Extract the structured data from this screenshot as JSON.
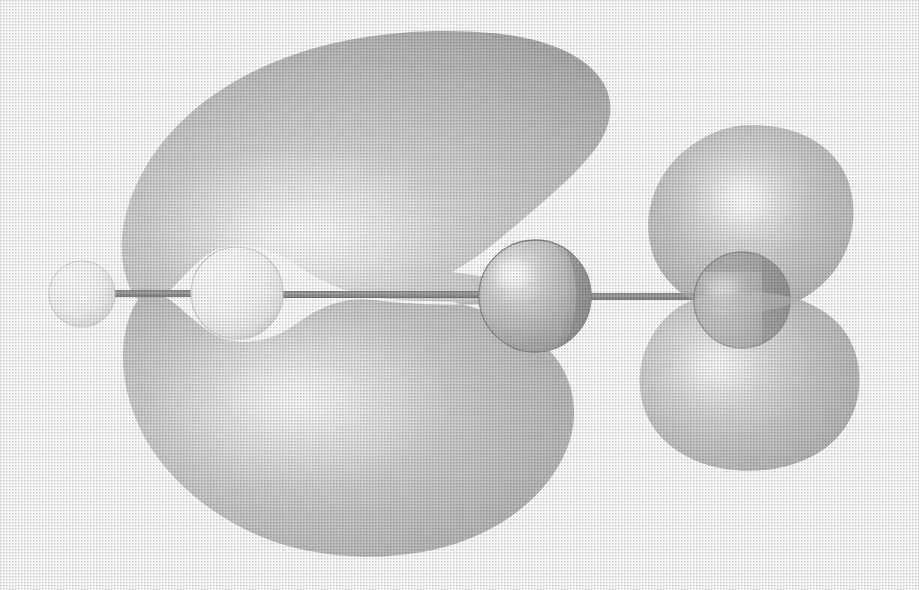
{
  "figure": {
    "kind": "molecular-orbital-isosurface",
    "title": "",
    "caption": "",
    "background_color": "#ffffff",
    "width": 919,
    "height": 590,
    "rendering_style": "halftone grayscale print scan",
    "view": "side view along molecular axis, orbital lobes above and below the bond axis"
  },
  "palette": {
    "background": "#ffffff",
    "lobe_base": "#c4c4c4",
    "lobe_mid": "#cfcfcf",
    "lobe_highlight": "#f2f2f2",
    "lobe_edge": "#a8a8a8",
    "lobe_shadow": "#b2b2b2",
    "atom_white_base": "#fbfbfb",
    "atom_white_edge": "#d8d8d8",
    "atom_mid_base": "#b9b9b9",
    "atom_mid_edge": "#8d8d8d",
    "atom_dark_base": "#9a9a9a",
    "atom_dark_edge": "#6a6a6a",
    "atom_dark_occluded": "#636363",
    "bond_color": "#9b9b9b",
    "bond_edge": "#7e7e7e",
    "specular": "#ffffff"
  },
  "molecule": {
    "axis_y": 297,
    "bond_thickness": 7,
    "atoms": [
      {
        "id": "atom-1",
        "label": "hydrogen-terminal",
        "shade": "white",
        "cx": 82,
        "cy": 294,
        "r": 33,
        "highlight_x": 70,
        "highlight_y": 278,
        "base_color": "#fbfbfb",
        "edge_color": "#dcdcdc"
      },
      {
        "id": "atom-2",
        "label": "carbon-inner-left",
        "shade": "white",
        "cx": 237,
        "cy": 293,
        "r": 46,
        "highlight_x": 221,
        "highlight_y": 272,
        "base_color": "#fcfcfc",
        "edge_color": "#d2d2d2"
      },
      {
        "id": "atom-3",
        "label": "carbon-inner-right",
        "shade": "mid-gray",
        "cx": 535,
        "cy": 296,
        "r": 56,
        "highlight_x": 512,
        "highlight_y": 273,
        "base_color": "#c0c0c0",
        "edge_color": "#8b8b8b"
      },
      {
        "id": "atom-4",
        "label": "nitrogen-terminal",
        "shade": "dark-gray",
        "cx": 742,
        "cy": 300,
        "r": 48,
        "highlight_x": 722,
        "highlight_y": 288,
        "base_color": "#a3a3a3",
        "edge_color": "#5f5f5f"
      }
    ],
    "bonds": [
      {
        "id": "bond-1-2",
        "from": "atom-1",
        "to": "atom-2",
        "x1": 100,
        "x2": 230
      },
      {
        "id": "bond-2-3",
        "from": "atom-2",
        "to": "atom-3",
        "x1": 245,
        "x2": 540
      },
      {
        "id": "bond-3-4",
        "from": "atom-3",
        "to": "atom-4",
        "x1": 580,
        "x2": 760
      }
    ]
  },
  "orbital_lobes": [
    {
      "id": "lobe-upper-left",
      "label": "large-upper-left-lobe",
      "sign": "phase-A",
      "bounds": {
        "x_min": 120,
        "x_max": 600,
        "y_min": 32,
        "y_max": 300
      },
      "highlight_x": 300,
      "highlight_y": 230,
      "shape": "pear-teardrop tapering right to a cusp at the inner-right atom",
      "fill": "#c9c9c9"
    },
    {
      "id": "lobe-lower-left",
      "label": "large-lower-left-lobe",
      "sign": "phase-B",
      "bounds": {
        "x_min": 118,
        "x_max": 600,
        "y_min": 300,
        "y_max": 552
      },
      "highlight_x": 300,
      "highlight_y": 400,
      "shape": "wide rounded lobe with a notch on the upper right, tapering to a cusp at the bond axis",
      "fill": "#c2c2c2"
    },
    {
      "id": "lobe-upper-right",
      "label": "small-upper-right-lobe",
      "sign": "phase-B",
      "bounds": {
        "x_min": 648,
        "x_max": 852,
        "y_min": 125,
        "y_max": 312
      },
      "highlight_x": 742,
      "highlight_y": 198,
      "shape": "ovoid egg",
      "fill": "#c7c7c7"
    },
    {
      "id": "lobe-lower-right",
      "label": "small-lower-right-lobe",
      "sign": "phase-A",
      "bounds": {
        "x_min": 640,
        "x_max": 858,
        "y_min": 292,
        "y_max": 472
      },
      "highlight_x": 718,
      "highlight_y": 372,
      "shape": "ovoid egg, slightly flattened",
      "fill": "#c5c5c5"
    }
  ],
  "annotations": {
    "items": []
  }
}
